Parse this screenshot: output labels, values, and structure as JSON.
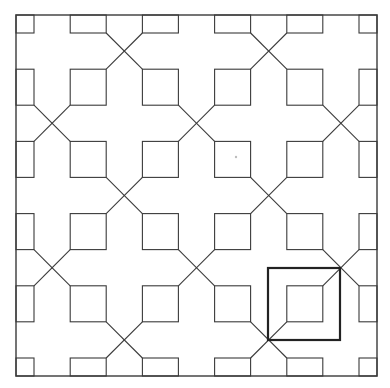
{
  "figure": {
    "type": "geometric tiling pattern",
    "stroke_color": "#3a3a3a",
    "background": "#ffffff",
    "border": {
      "x": 16,
      "y": 15,
      "size": 361
    },
    "lattice": {
      "origin": 16,
      "origin_y": 15,
      "spacing": 72.2,
      "count": 6,
      "square_size": 36
    },
    "crossing_rule": "diagonal crossings at lattice midpoints where (i + j) is odd",
    "highlight": {
      "x": 268,
      "y": 268,
      "size": 72,
      "stroke_width": 2.2,
      "color": "#222222"
    },
    "stray_dot": {
      "x": 236,
      "y": 157,
      "color": "#bdbdbd"
    }
  }
}
